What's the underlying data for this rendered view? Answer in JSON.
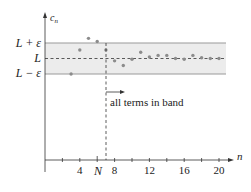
{
  "labels": {
    "y_axis": "c",
    "y_axis_sub": "n",
    "x_axis": "n",
    "upper": "L + ε",
    "mid": "L",
    "lower": "L − ε",
    "N": "N",
    "annotation": "all terms in band"
  },
  "ticks": [
    {
      "n": 2,
      "label": ""
    },
    {
      "n": 4,
      "label": "4"
    },
    {
      "n": 6,
      "label": ""
    },
    {
      "n": 8,
      "label": "8"
    },
    {
      "n": 10,
      "label": ""
    },
    {
      "n": 12,
      "label": "12"
    },
    {
      "n": 14,
      "label": ""
    },
    {
      "n": 16,
      "label": "16"
    },
    {
      "n": 18,
      "label": ""
    },
    {
      "n": 20,
      "label": "20"
    }
  ],
  "colors": {
    "band_fill": "#ececec",
    "band_edge": "#9a9a9a",
    "point": "#8c8c8c",
    "axis": "#333333",
    "text": "#222222"
  },
  "chart_data": {
    "type": "scatter",
    "title": "",
    "xlabel": "n",
    "ylabel": "c_n",
    "N": 6,
    "cutoff_line_n": 7,
    "band": {
      "upper": "L + ε",
      "center": "L",
      "lower": "L − ε"
    },
    "x": [
      3,
      4,
      5,
      6,
      7,
      8,
      9,
      10,
      11,
      12,
      13,
      14,
      15,
      16,
      17,
      18,
      19,
      20
    ],
    "y_relative_to_L_in_eps": [
      -1.0,
      0.55,
      1.3,
      1.1,
      0.55,
      -0.15,
      -0.45,
      -0.05,
      0.4,
      0.1,
      0.2,
      0.2,
      0.0,
      -0.05,
      0.2,
      0.05,
      0.0,
      0.0
    ],
    "xlim": [
      0,
      21
    ],
    "x_tick_labels": [
      "4",
      "N",
      "8",
      "12",
      "16",
      "20"
    ],
    "annotation": "all terms in band"
  }
}
